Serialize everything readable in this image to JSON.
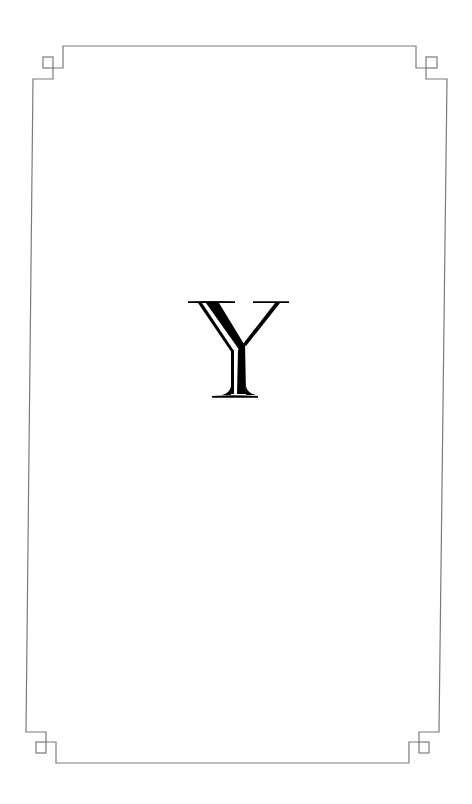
{
  "page": {
    "background": "#ffffff",
    "frame_color": "#7a7a7a",
    "letter_color": "#000000"
  },
  "ornament": {
    "initial": "Y",
    "style": "inline decorative serif capital"
  }
}
